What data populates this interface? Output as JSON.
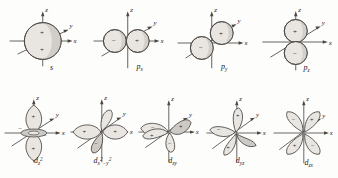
{
  "figure": {
    "background_color": "#fdfdfc",
    "line_color": "#4a4744",
    "lobe_fill": "#e9e6e2",
    "lobe_fill_shaded": "#cdc9c4",
    "text_color": "#23201d"
  },
  "axes": {
    "z_label": "z",
    "y_label": "y",
    "x_label": "x"
  },
  "signs": {
    "plus": "+",
    "minus": "−"
  },
  "orbitals": [
    {
      "id": "s",
      "name": "s-orbital",
      "label_plain": "s",
      "label_base": "s",
      "label_sub": "",
      "label_sup": "",
      "shape": "sphere",
      "lobe_count": 1,
      "lobe_signs": [
        "+",
        "+"
      ],
      "axes_shown": [
        "z",
        "y",
        "x"
      ]
    },
    {
      "id": "px",
      "name": "p-x-orbital",
      "label_plain": "px",
      "label_base": "p",
      "label_sub": "x",
      "label_sup": "",
      "shape": "two-lobes-along-x",
      "lobe_count": 2,
      "lobe_signs": [
        "−",
        "+"
      ],
      "axes_shown": [
        "z",
        "y",
        "x"
      ]
    },
    {
      "id": "py",
      "name": "p-y-orbital",
      "label_plain": "py",
      "label_base": "p",
      "label_sub": "y",
      "label_sup": "",
      "shape": "two-lobes-along-y",
      "lobe_count": 2,
      "lobe_signs": [
        "+",
        "−"
      ],
      "axes_shown": [
        "z",
        "y",
        "x"
      ]
    },
    {
      "id": "pz",
      "name": "p-z-orbital",
      "label_plain": "pz",
      "label_base": "p",
      "label_sub": "z",
      "label_sup": "",
      "shape": "two-lobes-along-z",
      "lobe_count": 2,
      "lobe_signs": [
        "+",
        "−"
      ],
      "axes_shown": [
        "z",
        "y",
        "x"
      ]
    },
    {
      "id": "dz2",
      "name": "d-z-squared-orbital",
      "label_plain": "dz2",
      "label_base": "d",
      "label_sub": "z",
      "label_sup": "2",
      "shape": "two-lobes-along-z-with-torus",
      "lobe_count": 2,
      "lobe_signs": [
        "+",
        "+"
      ],
      "torus_signs": [
        "−",
        "−"
      ],
      "axes_shown": [
        "z",
        "y",
        "x"
      ]
    },
    {
      "id": "dx2-y2",
      "name": "d-x-squared-minus-y-squared-orbital",
      "label_plain": "dx2-y2",
      "label_base": "d",
      "label_sub": "x",
      "label_sup": "2",
      "label_tail": "−y",
      "label_tail_sup": "2",
      "shape": "four-lobes-on-x-and-y-axes",
      "lobe_count": 4,
      "lobe_signs": [
        "+",
        "+",
        "−",
        "−"
      ],
      "axes_shown": [
        "z",
        "y",
        "x"
      ]
    },
    {
      "id": "dxy",
      "name": "d-xy-orbital",
      "label_plain": "dxy",
      "label_base": "d",
      "label_sub": "xy",
      "label_sup": "",
      "shape": "four-lobes-between-x-and-y",
      "lobe_count": 4,
      "lobe_signs": [
        "−",
        "+",
        "+",
        "−"
      ],
      "axes_shown": [
        "z",
        "y",
        "x"
      ]
    },
    {
      "id": "dyz",
      "name": "d-yz-orbital",
      "label_plain": "dyz",
      "label_base": "d",
      "label_sub": "yz",
      "label_sup": "",
      "shape": "four-lobes-between-y-and-z",
      "lobe_count": 4,
      "lobe_signs": [
        "−",
        "+",
        "+",
        "−"
      ],
      "axes_shown": [
        "z",
        "y",
        "x"
      ]
    },
    {
      "id": "dzx",
      "name": "d-zx-orbital",
      "label_plain": "dzx",
      "label_base": "d",
      "label_sub": "zx",
      "label_sup": "",
      "shape": "four-lobes-between-z-and-x",
      "lobe_count": 4,
      "lobe_signs": [
        "−",
        "+",
        "+",
        "−"
      ],
      "axes_shown": [
        "z",
        "y",
        "x"
      ]
    }
  ]
}
